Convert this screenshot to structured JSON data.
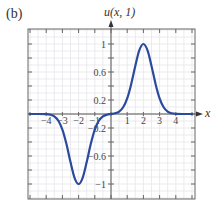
{
  "panel_label": "(b)",
  "chart_data": {
    "type": "line",
    "title": "",
    "xlabel": "x",
    "ylabel": "u(x, 1)",
    "xlim": [
      -5,
      5.3
    ],
    "ylim": [
      -1.2,
      1.2
    ],
    "grid": true,
    "x_ticks": [
      -4,
      -3,
      -2,
      -1,
      1,
      2,
      3,
      4
    ],
    "x_tick_labels": [
      "-4",
      "-3",
      "-2",
      "-1",
      "1",
      "2",
      "3",
      "4"
    ],
    "y_ticks": [
      1,
      0.6,
      0.2,
      -0.2,
      -0.6,
      -1
    ],
    "y_tick_labels": [
      "1",
      "0.6",
      "0.2",
      "-0.2",
      "-0.6",
      "-1"
    ],
    "series": [
      {
        "name": "u(x, 1)",
        "color": "#2b4a9e",
        "x": [
          -5,
          -4.5,
          -4,
          -3.75,
          -3.5,
          -3.25,
          -3,
          -2.75,
          -2.5,
          -2.25,
          -2,
          -1.75,
          -1.5,
          -1.25,
          -1,
          -0.75,
          -0.5,
          -0.25,
          0,
          0.25,
          0.5,
          0.75,
          1,
          1.25,
          1.5,
          1.75,
          2,
          2.25,
          2.5,
          2.75,
          3,
          3.25,
          3.5,
          3.75,
          4,
          4.5,
          5
        ],
        "values": [
          -0.0,
          -0.0001,
          -0.0025,
          -0.01,
          -0.034,
          -0.096,
          -0.223,
          -0.43,
          -0.687,
          -0.911,
          -1.0,
          -0.911,
          -0.687,
          -0.43,
          -0.223,
          -0.096,
          -0.034,
          -0.01,
          0.0,
          0.01,
          0.034,
          0.096,
          0.223,
          0.43,
          0.687,
          0.911,
          1.0,
          0.911,
          0.687,
          0.43,
          0.223,
          0.096,
          0.034,
          0.01,
          0.0025,
          0.0001,
          0.0
        ]
      }
    ]
  }
}
